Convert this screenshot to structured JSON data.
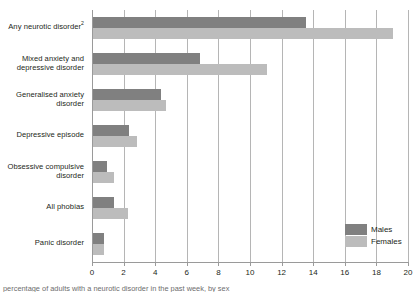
{
  "chart_data": {
    "type": "bar",
    "orientation": "horizontal",
    "title": "",
    "xlabel": "",
    "ylabel": "",
    "xlim": [
      0,
      20
    ],
    "xticks": [
      0,
      2,
      4,
      6,
      8,
      10,
      12,
      14,
      16,
      18,
      20
    ],
    "xtick_labels": [
      "0",
      "2",
      "4",
      "6",
      "8",
      "10",
      "12",
      "14",
      "16",
      "18",
      "20"
    ],
    "grid": true,
    "grid_axis": "x",
    "legend_position": "bottom-right",
    "categories": [
      "Any neurotic disorder",
      "Mixed anxiety and depressive disorder",
      "Generalised anxiety disorder",
      "Depressive episode",
      "Obsessive compulsive disorder",
      "All phobias",
      "Panic disorder"
    ],
    "category_labels": [
      {
        "line1": "Any neurotic disorder",
        "line2": "",
        "superscript": "2"
      },
      {
        "line1": "Mixed anxiety and",
        "line2": "depressive disorder",
        "superscript": ""
      },
      {
        "line1": "Generalised anxiety",
        "line2": "disorder",
        "superscript": ""
      },
      {
        "line1": "Depressive episode",
        "line2": "",
        "superscript": ""
      },
      {
        "line1": "Obsessive compulsive",
        "line2": "disorder",
        "superscript": ""
      },
      {
        "line1": "All phobias",
        "line2": "",
        "superscript": ""
      },
      {
        "line1": "Panic disorder",
        "line2": "",
        "superscript": ""
      }
    ],
    "series": [
      {
        "name": "Males",
        "color": "#808080",
        "values": [
          13.5,
          6.8,
          4.3,
          2.3,
          0.9,
          1.3,
          0.7
        ]
      },
      {
        "name": "Females",
        "color": "#bcbcbc",
        "values": [
          19.0,
          11.0,
          4.6,
          2.8,
          1.3,
          2.2,
          0.7
        ]
      }
    ]
  },
  "legend": {
    "items": [
      {
        "label": "Males",
        "color": "#808080"
      },
      {
        "label": "Females",
        "color": "#bcbcbc"
      }
    ]
  },
  "caption": {
    "text": "percentage of adults with a neurotic disorder in the past week, by sex"
  }
}
